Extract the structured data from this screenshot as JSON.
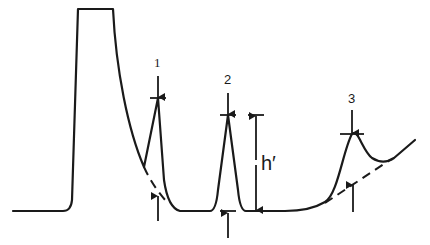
{
  "diagram": {
    "type": "chromatogram-peak-height-measurement",
    "peak_labels": [
      "1",
      "2",
      "3"
    ],
    "height_label": "h′",
    "colors": {
      "line": "#1a1a1a",
      "background": "#ffffff"
    }
  }
}
